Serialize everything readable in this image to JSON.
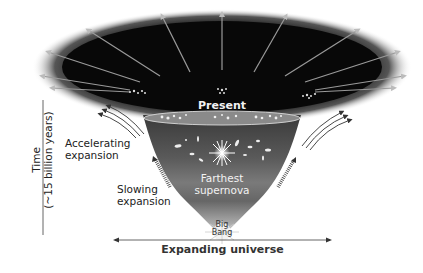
{
  "diagram": {
    "type": "expanding-universe-funnel",
    "labels": {
      "present": "Present",
      "accelerating_line1": "Accelerating",
      "accelerating_line2": "expansion",
      "slowing_line1": "Slowing",
      "slowing_line2": "expansion",
      "farthest_line1": "Farthest",
      "farthest_line2": "supernova",
      "big_line1": "Big",
      "big_line2": "Bang",
      "x_axis": "Expanding universe",
      "y_axis_line1": "Time",
      "y_axis_line2": "(~15 billion years)"
    },
    "colors": {
      "outer_dark": "#0a0a0a",
      "funnel_top": "#2a2a2a",
      "funnel_mid": "#6b6b6b",
      "funnel_bottom": "#bdbdbd",
      "text_dark": "#222222",
      "text_light": "#f2f2f2"
    }
  }
}
